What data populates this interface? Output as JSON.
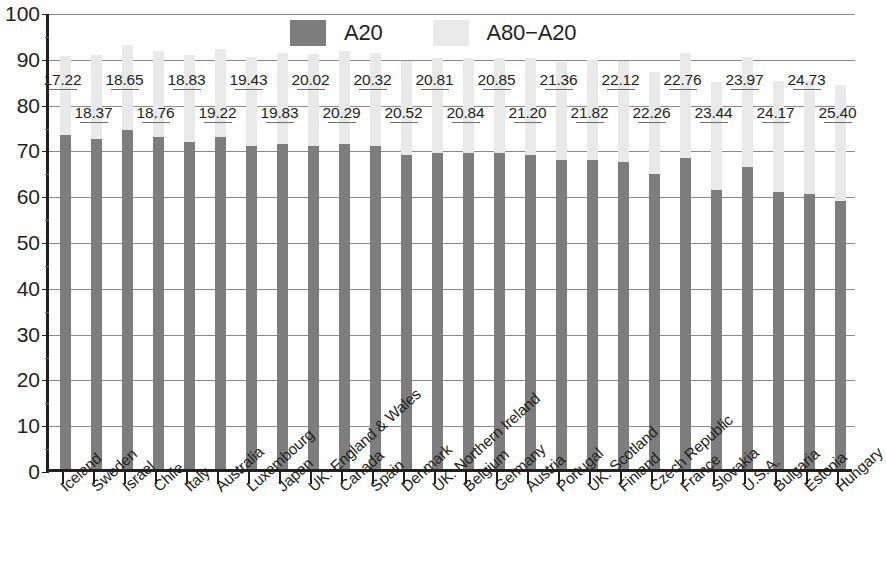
{
  "chart_data": {
    "type": "bar",
    "title": "",
    "subtitle": "",
    "xlabel": "",
    "ylabel": "",
    "ylim": [
      0,
      100
    ],
    "ytick_step": 10,
    "yticks": [
      "0",
      "10",
      "20",
      "30",
      "40",
      "50",
      "60",
      "70",
      "80",
      "90",
      "100"
    ],
    "grid": true,
    "stacked": true,
    "legend_position": "top-center",
    "legend": [
      "A20",
      "A80−A20"
    ],
    "colors": {
      "A20": "#7d7d7d",
      "A80_A20": "#e9e9e9",
      "axis": "#231f20",
      "grid": "#8b8b8b"
    },
    "categories": [
      "Iceland",
      "Sweden",
      "Israel",
      "Chile",
      "Italy",
      "Australia",
      "Luxembourg",
      "Japan",
      "UK: England & Wales",
      "Canada",
      "Spain",
      "Denmark",
      "UK: Northern Ireland",
      "Belgium",
      "Germany",
      "Austria",
      "Portugal",
      "UK: Scotland",
      "Finland",
      "Czech Republic",
      "France",
      "Slovakia",
      "U.S.A.",
      "Bulgaria",
      "Estonia",
      "Hungary"
    ],
    "series": [
      {
        "name": "A20",
        "values": [
          73.0,
          72.0,
          74.0,
          72.5,
          71.5,
          72.5,
          70.5,
          71.0,
          70.5,
          71.0,
          70.5,
          68.5,
          69.0,
          69.0,
          69.0,
          68.5,
          67.5,
          67.5,
          67.0,
          64.5,
          68.0,
          61.0,
          66.0,
          60.5,
          60.0,
          58.5
        ]
      },
      {
        "name": "A80−A20",
        "values": [
          17.22,
          18.37,
          18.65,
          18.76,
          18.83,
          19.22,
          19.43,
          19.83,
          20.02,
          20.29,
          20.32,
          20.52,
          20.81,
          20.84,
          20.85,
          21.2,
          21.36,
          21.82,
          22.12,
          22.26,
          22.76,
          23.44,
          23.97,
          24.17,
          24.73,
          25.4
        ]
      }
    ],
    "data_labels": [
      "17.22",
      "18.37",
      "18.65",
      "18.76",
      "18.83",
      "19.22",
      "19.43",
      "19.83",
      "20.02",
      "20.29",
      "20.32",
      "20.52",
      "20.81",
      "20.84",
      "20.85",
      "21.20",
      "21.36",
      "21.82",
      "22.12",
      "22.26",
      "22.76",
      "23.44",
      "23.97",
      "24.17",
      "24.73",
      "25.40"
    ],
    "data_label_rows": [
      0,
      1,
      0,
      1,
      0,
      1,
      0,
      1,
      0,
      1,
      0,
      1,
      0,
      1,
      0,
      1,
      0,
      1,
      0,
      1,
      0,
      1,
      0,
      1,
      0,
      1
    ]
  }
}
